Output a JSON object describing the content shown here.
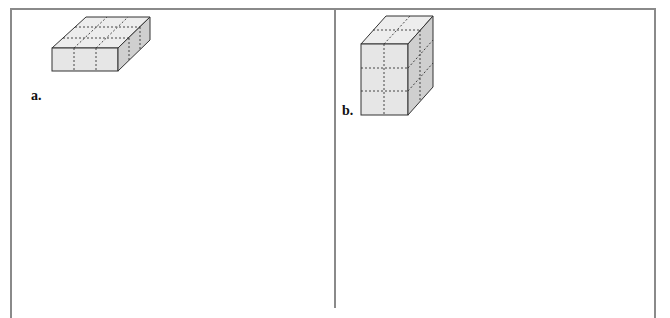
{
  "panels": [
    {
      "label": "a.",
      "figure": "rectangular-prism",
      "layout": {
        "length_units": 3,
        "width_units": 3,
        "height_units": 1
      }
    },
    {
      "label": "b.",
      "figure": "rectangular-prism",
      "layout": {
        "length_units": 2,
        "width_units": 2,
        "height_units": 3
      }
    }
  ],
  "colors": {
    "border": "#8a8a8a",
    "front_face": "#e6e6e6",
    "top_face": "#ededed",
    "side_face": "#cfcfcf",
    "edge": "#333333"
  }
}
